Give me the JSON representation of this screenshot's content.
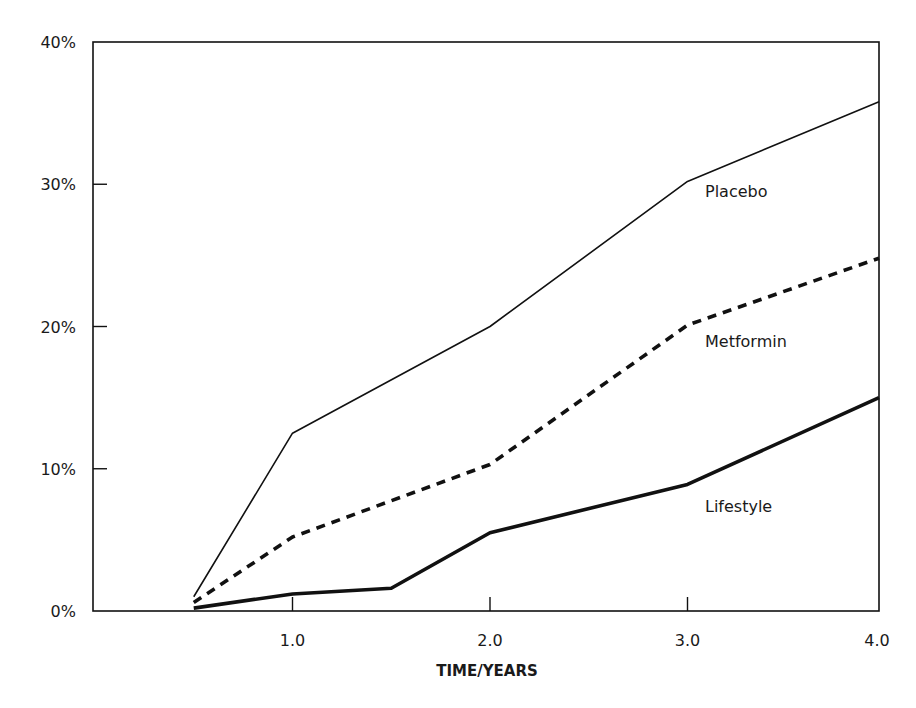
{
  "chart_data": {
    "type": "line",
    "title": "",
    "xlabel": "TIME/YEARS",
    "ylabel": "",
    "x": [
      0.5,
      1.0,
      1.5,
      2.0,
      3.0,
      4.0
    ],
    "xticks": [
      1.0,
      2.0,
      3.0,
      4.0
    ],
    "xtick_labels": [
      "1.0",
      "2.0",
      "3.0",
      "4.0"
    ],
    "xlim": [
      0,
      4.0
    ],
    "yticks": [
      0,
      10,
      20,
      30,
      40
    ],
    "ytick_labels": [
      "0%",
      "10%",
      "20%",
      "30%",
      "40%"
    ],
    "ylim": [
      0,
      40
    ],
    "grid": false,
    "legend_position": "inline labels at right",
    "series": [
      {
        "name": "Placebo",
        "style": "solid-thin",
        "x": [
          0.5,
          1.0,
          2.0,
          3.0,
          4.0
        ],
        "values": [
          1.0,
          12.5,
          20.0,
          30.2,
          35.8
        ]
      },
      {
        "name": "Metformin",
        "style": "dashed",
        "x": [
          0.5,
          1.0,
          2.0,
          3.0,
          4.0
        ],
        "values": [
          0.6,
          5.2,
          10.3,
          20.1,
          24.8
        ]
      },
      {
        "name": "Lifestyle",
        "style": "solid-thick",
        "x": [
          0.5,
          1.0,
          1.5,
          2.0,
          3.0,
          4.0
        ],
        "values": [
          0.2,
          1.2,
          1.6,
          5.5,
          8.9,
          15.0
        ]
      }
    ],
    "annotations": [
      {
        "text": "Placebo",
        "x": 3.1,
        "y": 29.5
      },
      {
        "text": "Metformin",
        "x": 3.1,
        "y": 19.0
      },
      {
        "text": "Lifestyle",
        "x": 3.1,
        "y": 7.4
      }
    ]
  },
  "colors": {
    "line": "#111111",
    "axis": "#111111",
    "background": "#ffffff"
  }
}
